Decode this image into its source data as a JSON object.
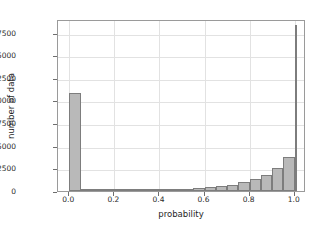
{
  "chart_data": {
    "type": "bar",
    "title": "",
    "xlabel": "probability",
    "ylabel": "number of data",
    "xlim": [
      -0.05,
      1.05
    ],
    "ylim": [
      0,
      19000
    ],
    "grid": true,
    "legend": null,
    "bin_width": 0.05,
    "bin_edges": [
      0.0,
      0.05,
      0.1,
      0.15,
      0.2,
      0.25,
      0.3,
      0.35,
      0.4,
      0.45,
      0.5,
      0.55,
      0.6,
      0.65,
      0.7,
      0.75,
      0.8,
      0.85,
      0.9,
      0.95,
      1.0
    ],
    "categories": [
      "0.00-0.05",
      "0.05-0.10",
      "0.10-0.15",
      "0.15-0.20",
      "0.20-0.25",
      "0.25-0.30",
      "0.30-0.35",
      "0.35-0.40",
      "0.40-0.45",
      "0.45-0.50",
      "0.50-0.55",
      "0.55-0.60",
      "0.60-0.65",
      "0.65-0.70",
      "0.70-0.75",
      "0.75-0.80",
      "0.80-0.85",
      "0.85-0.90",
      "0.90-0.95",
      "0.95-1.00"
    ],
    "values": [
      10800,
      230,
      150,
      90,
      80,
      80,
      90,
      110,
      150,
      160,
      230,
      300,
      420,
      520,
      700,
      950,
      1300,
      1800,
      2500,
      3750
    ],
    "last_value": 18300,
    "xticks": [
      {
        "value": 0.0,
        "label": "0.0"
      },
      {
        "value": 0.2,
        "label": "0.2"
      },
      {
        "value": 0.4,
        "label": "0.4"
      },
      {
        "value": 0.6,
        "label": "0.6"
      },
      {
        "value": 0.8,
        "label": "0.8"
      },
      {
        "value": 1.0,
        "label": "1.0"
      }
    ],
    "yticks": [
      {
        "value": 0,
        "label": "0"
      },
      {
        "value": 2500,
        "label": "2500"
      },
      {
        "value": 5000,
        "label": "5000"
      },
      {
        "value": 7500,
        "label": "7500"
      },
      {
        "value": 10000,
        "label": "10000"
      },
      {
        "value": 12500,
        "label": "12500"
      },
      {
        "value": 15000,
        "label": "15000"
      },
      {
        "value": 17500,
        "label": "17500"
      }
    ],
    "colors": {
      "bar_fill": "#b9b9b9",
      "bar_edge": "#7d7d7d",
      "grid": "#e2e2e2",
      "axis": "#9a9a9a",
      "text": "#1f1f1f",
      "background": "#ffffff"
    }
  }
}
